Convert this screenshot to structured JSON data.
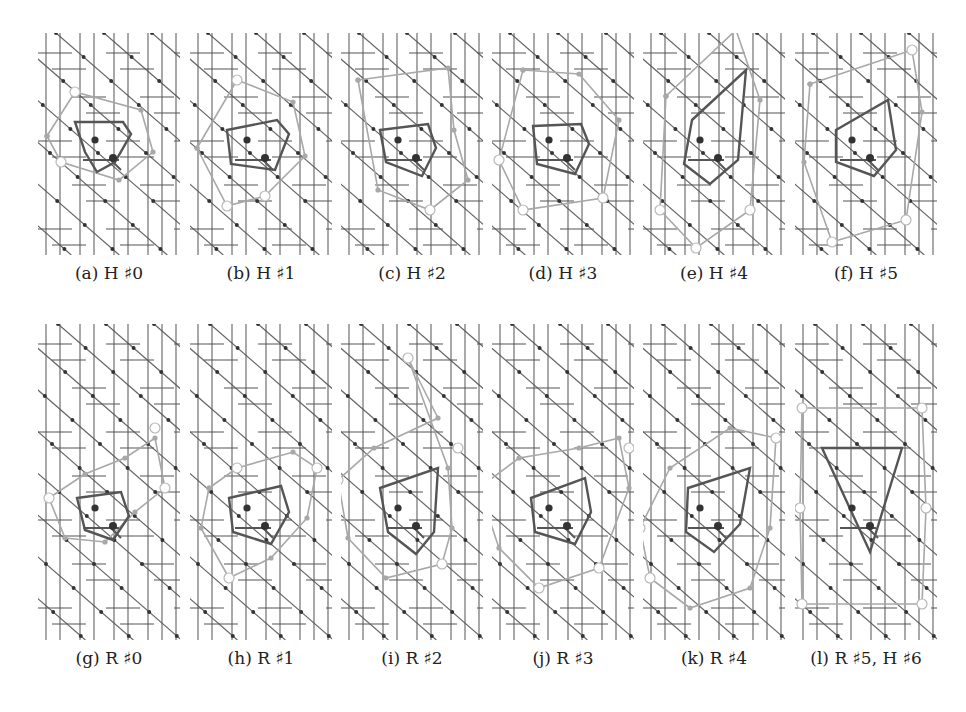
{
  "figure": {
    "panels": [
      {
        "id": "a",
        "caption": "(a) H ♯0",
        "x": 38,
        "y": 33,
        "w": 142,
        "h": 222,
        "variant": "H0"
      },
      {
        "id": "b",
        "caption": "(b) H ♯1",
        "x": 190,
        "y": 33,
        "w": 142,
        "h": 222,
        "variant": "H1"
      },
      {
        "id": "c",
        "caption": "(c) H ♯2",
        "x": 341,
        "y": 33,
        "w": 142,
        "h": 222,
        "variant": "H2"
      },
      {
        "id": "d",
        "caption": "(d) H ♯3",
        "x": 492,
        "y": 33,
        "w": 142,
        "h": 222,
        "variant": "H3"
      },
      {
        "id": "e",
        "caption": "(e) H ♯4",
        "x": 643,
        "y": 33,
        "w": 142,
        "h": 222,
        "variant": "H4"
      },
      {
        "id": "f",
        "caption": "(f) H ♯5",
        "x": 795,
        "y": 33,
        "w": 142,
        "h": 222,
        "variant": "H5"
      },
      {
        "id": "g",
        "caption": "(g) R ♯0",
        "x": 38,
        "y": 324,
        "w": 142,
        "h": 316,
        "variant": "R0"
      },
      {
        "id": "h",
        "caption": "(h) R ♯1",
        "x": 190,
        "y": 324,
        "w": 142,
        "h": 316,
        "variant": "R1"
      },
      {
        "id": "i",
        "caption": "(i) R ♯2",
        "x": 341,
        "y": 324,
        "w": 142,
        "h": 316,
        "variant": "R2"
      },
      {
        "id": "j",
        "caption": "(j) R ♯3",
        "x": 492,
        "y": 324,
        "w": 142,
        "h": 316,
        "variant": "R3"
      },
      {
        "id": "k",
        "caption": "(k) R ♯4",
        "x": 643,
        "y": 324,
        "w": 142,
        "h": 316,
        "variant": "R4"
      },
      {
        "id": "l",
        "caption": "(l) R ♯5, H ♯6",
        "x": 795,
        "y": 324,
        "w": 142,
        "h": 316,
        "variant": "R5"
      }
    ],
    "colors": {
      "lattice": "#555555",
      "node": "#333333",
      "path": "#a8a8a8",
      "path_ring": "#b8b8b8",
      "polygon": "#555555",
      "center": "#333333"
    }
  }
}
